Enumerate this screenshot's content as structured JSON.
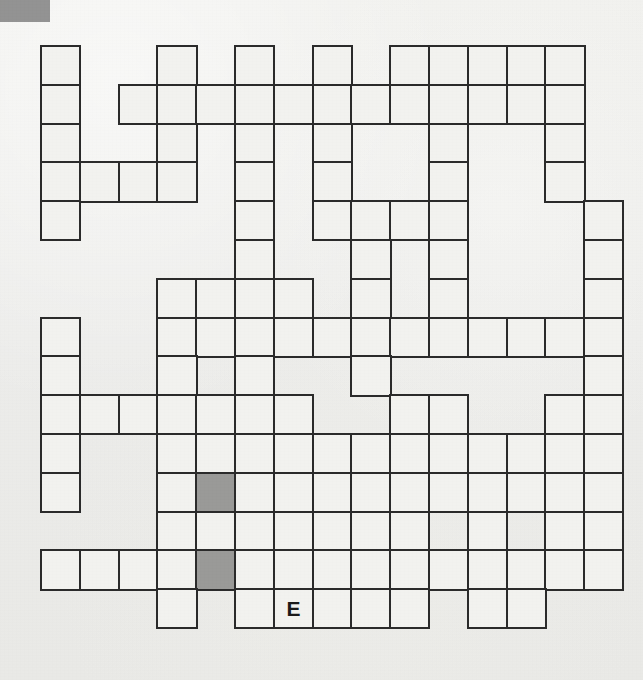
{
  "page": {
    "background_color": "#efefec",
    "corner_mark_color": "#8a8a8a"
  },
  "grid": {
    "columns": 15,
    "rows": 15,
    "cell_size": 38.8,
    "origin_x": 40,
    "origin_y": 45,
    "border_color": "#2b2b2b",
    "cell_fill": "#f2f2ef",
    "shaded_fill": "#9a9a98",
    "filled_cells": [
      {
        "row": 0,
        "col": 0
      },
      {
        "row": 0,
        "col": 3
      },
      {
        "row": 0,
        "col": 5
      },
      {
        "row": 0,
        "col": 7
      },
      {
        "row": 0,
        "col": 9
      },
      {
        "row": 0,
        "col": 10
      },
      {
        "row": 0,
        "col": 11
      },
      {
        "row": 0,
        "col": 12
      },
      {
        "row": 0,
        "col": 13
      },
      {
        "row": 1,
        "col": 0
      },
      {
        "row": 1,
        "col": 2
      },
      {
        "row": 1,
        "col": 3
      },
      {
        "row": 1,
        "col": 4
      },
      {
        "row": 1,
        "col": 5
      },
      {
        "row": 1,
        "col": 6
      },
      {
        "row": 1,
        "col": 7
      },
      {
        "row": 1,
        "col": 8
      },
      {
        "row": 1,
        "col": 9
      },
      {
        "row": 1,
        "col": 10
      },
      {
        "row": 1,
        "col": 11
      },
      {
        "row": 1,
        "col": 12
      },
      {
        "row": 1,
        "col": 13
      },
      {
        "row": 2,
        "col": 0
      },
      {
        "row": 2,
        "col": 3
      },
      {
        "row": 2,
        "col": 5
      },
      {
        "row": 2,
        "col": 7
      },
      {
        "row": 2,
        "col": 10
      },
      {
        "row": 2,
        "col": 13
      },
      {
        "row": 3,
        "col": 0
      },
      {
        "row": 3,
        "col": 1
      },
      {
        "row": 3,
        "col": 2
      },
      {
        "row": 3,
        "col": 3
      },
      {
        "row": 3,
        "col": 5
      },
      {
        "row": 3,
        "col": 7
      },
      {
        "row": 3,
        "col": 10
      },
      {
        "row": 3,
        "col": 13
      },
      {
        "row": 4,
        "col": 0
      },
      {
        "row": 4,
        "col": 5
      },
      {
        "row": 4,
        "col": 7
      },
      {
        "row": 4,
        "col": 8
      },
      {
        "row": 4,
        "col": 9
      },
      {
        "row": 4,
        "col": 10
      },
      {
        "row": 4,
        "col": 14
      },
      {
        "row": 5,
        "col": 5
      },
      {
        "row": 5,
        "col": 8
      },
      {
        "row": 5,
        "col": 10
      },
      {
        "row": 5,
        "col": 14
      },
      {
        "row": 6,
        "col": 3
      },
      {
        "row": 6,
        "col": 4
      },
      {
        "row": 6,
        "col": 5
      },
      {
        "row": 6,
        "col": 6
      },
      {
        "row": 6,
        "col": 8
      },
      {
        "row": 6,
        "col": 10
      },
      {
        "row": 6,
        "col": 14
      },
      {
        "row": 7,
        "col": 0
      },
      {
        "row": 7,
        "col": 3
      },
      {
        "row": 7,
        "col": 4
      },
      {
        "row": 7,
        "col": 5
      },
      {
        "row": 7,
        "col": 6
      },
      {
        "row": 7,
        "col": 7
      },
      {
        "row": 7,
        "col": 8
      },
      {
        "row": 7,
        "col": 9
      },
      {
        "row": 7,
        "col": 10
      },
      {
        "row": 7,
        "col": 11
      },
      {
        "row": 7,
        "col": 12
      },
      {
        "row": 7,
        "col": 13
      },
      {
        "row": 7,
        "col": 14
      },
      {
        "row": 8,
        "col": 0
      },
      {
        "row": 8,
        "col": 3
      },
      {
        "row": 8,
        "col": 5
      },
      {
        "row": 8,
        "col": 8
      },
      {
        "row": 8,
        "col": 14
      },
      {
        "row": 9,
        "col": 0
      },
      {
        "row": 9,
        "col": 1
      },
      {
        "row": 9,
        "col": 2
      },
      {
        "row": 9,
        "col": 3
      },
      {
        "row": 9,
        "col": 4
      },
      {
        "row": 9,
        "col": 5
      },
      {
        "row": 9,
        "col": 6
      },
      {
        "row": 9,
        "col": 9
      },
      {
        "row": 9,
        "col": 10
      },
      {
        "row": 9,
        "col": 13
      },
      {
        "row": 9,
        "col": 14
      },
      {
        "row": 10,
        "col": 0
      },
      {
        "row": 10,
        "col": 3
      },
      {
        "row": 10,
        "col": 4
      },
      {
        "row": 10,
        "col": 5
      },
      {
        "row": 10,
        "col": 6
      },
      {
        "row": 10,
        "col": 7
      },
      {
        "row": 10,
        "col": 8
      },
      {
        "row": 10,
        "col": 9
      },
      {
        "row": 10,
        "col": 10
      },
      {
        "row": 10,
        "col": 11
      },
      {
        "row": 10,
        "col": 12
      },
      {
        "row": 10,
        "col": 13
      },
      {
        "row": 10,
        "col": 14
      },
      {
        "row": 11,
        "col": 0
      },
      {
        "row": 11,
        "col": 3
      },
      {
        "row": 11,
        "col": 4
      },
      {
        "row": 11,
        "col": 5
      },
      {
        "row": 11,
        "col": 6
      },
      {
        "row": 11,
        "col": 7
      },
      {
        "row": 11,
        "col": 8
      },
      {
        "row": 11,
        "col": 9
      },
      {
        "row": 11,
        "col": 10
      },
      {
        "row": 11,
        "col": 11
      },
      {
        "row": 11,
        "col": 12
      },
      {
        "row": 11,
        "col": 13
      },
      {
        "row": 11,
        "col": 14
      },
      {
        "row": 12,
        "col": 3
      },
      {
        "row": 12,
        "col": 4
      },
      {
        "row": 12,
        "col": 5
      },
      {
        "row": 12,
        "col": 6
      },
      {
        "row": 12,
        "col": 7
      },
      {
        "row": 12,
        "col": 8
      },
      {
        "row": 12,
        "col": 9
      },
      {
        "row": 12,
        "col": 11
      },
      {
        "row": 12,
        "col": 13
      },
      {
        "row": 12,
        "col": 14
      },
      {
        "row": 13,
        "col": 0
      },
      {
        "row": 13,
        "col": 1
      },
      {
        "row": 13,
        "col": 2
      },
      {
        "row": 13,
        "col": 3
      },
      {
        "row": 13,
        "col": 4
      },
      {
        "row": 13,
        "col": 5
      },
      {
        "row": 13,
        "col": 6
      },
      {
        "row": 13,
        "col": 7
      },
      {
        "row": 13,
        "col": 8
      },
      {
        "row": 13,
        "col": 9
      },
      {
        "row": 13,
        "col": 10
      },
      {
        "row": 13,
        "col": 11
      },
      {
        "row": 13,
        "col": 12
      },
      {
        "row": 13,
        "col": 13
      },
      {
        "row": 13,
        "col": 14
      },
      {
        "row": 14,
        "col": 3
      },
      {
        "row": 14,
        "col": 5
      },
      {
        "row": 14,
        "col": 6
      },
      {
        "row": 14,
        "col": 7
      },
      {
        "row": 14,
        "col": 8
      },
      {
        "row": 14,
        "col": 9
      },
      {
        "row": 14,
        "col": 11
      },
      {
        "row": 14,
        "col": 12
      }
    ],
    "shaded_cells": [
      {
        "row": 11,
        "col": 4
      },
      {
        "row": 13,
        "col": 4
      }
    ],
    "letters": [
      {
        "row": 14,
        "col": 6,
        "letter": "E"
      }
    ]
  }
}
